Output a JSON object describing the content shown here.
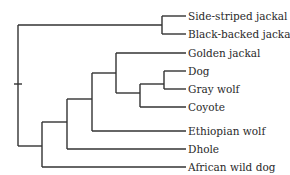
{
  "diagram": {
    "type": "phylogenetic-tree",
    "taxa": [
      {
        "label": "Side-striped jackal",
        "y": 16
      },
      {
        "label": "Black-backed jackal",
        "y": 34
      },
      {
        "label": "Golden jackal",
        "y": 52
      },
      {
        "label": "Dog",
        "y": 71
      },
      {
        "label": "Gray wolf",
        "y": 89
      },
      {
        "label": "Coyote",
        "y": 107
      },
      {
        "label": "Ethiopian wolf",
        "y": 126
      },
      {
        "label": "Dhole",
        "y": 144
      },
      {
        "label": "African wild dog",
        "y": 162
      }
    ],
    "colors": {
      "branch": "#333333",
      "text": "#2a2a2a",
      "background": "#ffffff"
    }
  }
}
